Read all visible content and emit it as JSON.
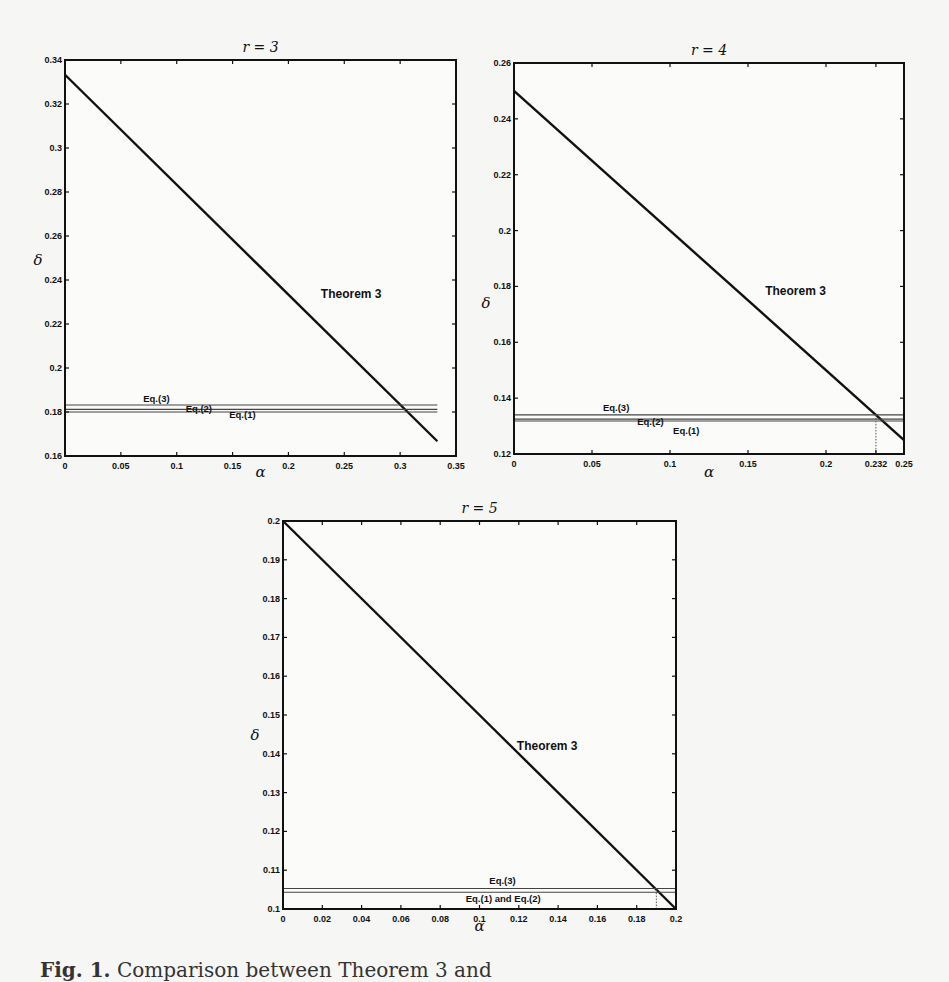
{
  "figure": {
    "caption_label": "Fig. 1.",
    "caption_text": "Comparison between Theorem 3 and"
  },
  "chart_data": [
    {
      "type": "line",
      "title": "r = 3",
      "xlabel": "α",
      "ylabel": "δ",
      "xlim": [
        0,
        0.35
      ],
      "ylim": [
        0.16,
        0.34
      ],
      "xticks": [
        "0",
        "0.05",
        "0.1",
        "0.15",
        "0.2",
        "0.25",
        "0.3",
        "0.35"
      ],
      "xtick_values": [
        0,
        0.05,
        0.1,
        0.15,
        0.2,
        0.25,
        0.3,
        0.35
      ],
      "yticks": [
        "0.16",
        "0.18",
        "0.2",
        "0.22",
        "0.24",
        "0.26",
        "0.28",
        "0.3",
        "0.32",
        "0.34"
      ],
      "ytick_values": [
        0.16,
        0.18,
        0.2,
        0.22,
        0.24,
        0.26,
        0.28,
        0.3,
        0.32,
        0.34
      ],
      "series": [
        {
          "name": "Theorem 3",
          "x": [
            0,
            0.3333
          ],
          "y": [
            0.3333,
            0.1667
          ],
          "style": "thick"
        },
        {
          "name": "Eq.(3)",
          "x": [
            0,
            0.3333
          ],
          "y": [
            0.1832,
            0.1832
          ],
          "style": "thin"
        },
        {
          "name": "Eq.(2)",
          "x": [
            0,
            0.3333
          ],
          "y": [
            0.1812,
            0.1812
          ],
          "style": "thin"
        },
        {
          "name": "Eq.(1)",
          "x": [
            0,
            0.3333
          ],
          "y": [
            0.18,
            0.18
          ],
          "style": "thin"
        }
      ],
      "annotations": [
        {
          "text": "Theorem 3",
          "x": 0.229,
          "y": 0.232,
          "size": "large"
        },
        {
          "text": "Eq.(3)",
          "x": 0.07,
          "y": 0.1845,
          "size": "small"
        },
        {
          "text": "Eq.(2)",
          "x": 0.108,
          "y": 0.1802,
          "size": "small"
        },
        {
          "text": "Eq.(1)",
          "x": 0.147,
          "y": 0.1775,
          "size": "small"
        }
      ],
      "markers": []
    },
    {
      "type": "line",
      "title": "r = 4",
      "xlabel": "α",
      "ylabel": "δ",
      "xlim": [
        0,
        0.25
      ],
      "ylim": [
        0.12,
        0.26
      ],
      "xticks": [
        "0",
        "0.05",
        "0.1",
        "0.15",
        "0.2",
        "0.232",
        "0.25"
      ],
      "xtick_values": [
        0,
        0.05,
        0.1,
        0.15,
        0.2,
        0.232,
        0.25
      ],
      "yticks": [
        "0.12",
        "0.14",
        "0.16",
        "0.18",
        "0.2",
        "0.22",
        "0.24",
        "0.26"
      ],
      "ytick_values": [
        0.12,
        0.14,
        0.16,
        0.18,
        0.2,
        0.22,
        0.24,
        0.26
      ],
      "series": [
        {
          "name": "Theorem 3",
          "x": [
            0,
            0.25
          ],
          "y": [
            0.25,
            0.125
          ],
          "style": "thick"
        },
        {
          "name": "Eq.(3)",
          "x": [
            0,
            0.25
          ],
          "y": [
            0.134,
            0.134
          ],
          "style": "thin"
        },
        {
          "name": "Eq.(2)",
          "x": [
            0,
            0.25
          ],
          "y": [
            0.1325,
            0.1325
          ],
          "style": "thin"
        },
        {
          "name": "Eq.(1)",
          "x": [
            0,
            0.25
          ],
          "y": [
            0.1318,
            0.1318
          ],
          "style": "thin"
        }
      ],
      "annotations": [
        {
          "text": "Theorem 3",
          "x": 0.161,
          "y": 0.177,
          "size": "large"
        },
        {
          "text": "Eq.(3)",
          "x": 0.057,
          "y": 0.1355,
          "size": "small"
        },
        {
          "text": "Eq.(2)",
          "x": 0.079,
          "y": 0.1305,
          "size": "small"
        },
        {
          "text": "Eq.(1)",
          "x": 0.102,
          "y": 0.1272,
          "size": "small"
        }
      ],
      "markers": [
        {
          "type": "dotted-vertical",
          "x": 0.232,
          "y_top": 0.134
        }
      ]
    },
    {
      "type": "line",
      "title": "r = 5",
      "xlabel": "α",
      "ylabel": "δ",
      "xlim": [
        0,
        0.2
      ],
      "ylim": [
        0.1,
        0.2
      ],
      "xticks": [
        "0",
        "0.02",
        "0.04",
        "0.06",
        "0.08",
        "0.1",
        "0.12",
        "0.14",
        "0.16",
        "0.18",
        "0.2"
      ],
      "xtick_values": [
        0,
        0.02,
        0.04,
        0.06,
        0.08,
        0.1,
        0.12,
        0.14,
        0.16,
        0.18,
        0.2
      ],
      "yticks": [
        "0.1",
        "0.11",
        "0.12",
        "0.13",
        "0.14",
        "0.15",
        "0.16",
        "0.17",
        "0.18",
        "0.19",
        "0.2"
      ],
      "ytick_values": [
        0.1,
        0.11,
        0.12,
        0.13,
        0.14,
        0.15,
        0.16,
        0.17,
        0.18,
        0.19,
        0.2
      ],
      "series": [
        {
          "name": "Theorem 3",
          "x": [
            0,
            0.2
          ],
          "y": [
            0.2,
            0.1
          ],
          "style": "thick"
        },
        {
          "name": "Eq.(3)",
          "x": [
            0,
            0.2
          ],
          "y": [
            0.1053,
            0.1053
          ],
          "style": "thin"
        },
        {
          "name": "Eq.(1) and Eq.(2)",
          "x": [
            0,
            0.2
          ],
          "y": [
            0.1043,
            0.1043
          ],
          "style": "thin"
        }
      ],
      "annotations": [
        {
          "text": "Theorem 3",
          "x": 0.119,
          "y": 0.141,
          "size": "large"
        },
        {
          "text": "Eq.(3)",
          "x": 0.105,
          "y": 0.1065,
          "size": "small"
        },
        {
          "text": "Eq.(1) and Eq.(2)",
          "x": 0.093,
          "y": 0.1018,
          "size": "small"
        }
      ],
      "markers": [
        {
          "type": "dotted-vertical",
          "x": 0.19,
          "y_top": 0.105
        }
      ]
    }
  ]
}
